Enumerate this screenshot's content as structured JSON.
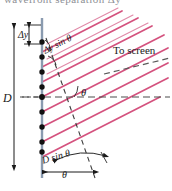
{
  "figure": {
    "name": "diffraction-grating-path-difference-diagram",
    "type": "optics-ray-diagram",
    "background_color": "#ffffff"
  },
  "colors": {
    "ray": "#d4527e",
    "ray_light": "#e08aa8",
    "grating_line": "#8a9bb0",
    "ink": "#1a1a1a",
    "dash": "#4d4d4d",
    "clipped_text": "#8e9096"
  },
  "clipped_top_text": "wavefront separation  Δy",
  "labels": {
    "delta_y": "Δy",
    "delta_y_sin_theta": "Δy sin θ",
    "D": "D",
    "D_sin_theta": "D sin θ",
    "theta_middle": "θ",
    "theta_bottom": "θ",
    "to_screen": "To screen"
  },
  "elements": {
    "grating_plane": {
      "name": "grating-plane-vertical-line",
      "orientation": "vertical",
      "x": 42,
      "y_top": 18,
      "y_bottom": 178,
      "color": "#8a9bb0"
    },
    "slits": {
      "name": "slit-dot-column",
      "count": 9,
      "x": 42,
      "y_values": [
        42,
        57,
        72,
        87,
        97,
        112,
        127,
        142,
        152
      ],
      "color": "#111111",
      "radius": 2.6
    },
    "wavefronts": {
      "name": "pink-wavefront-rays",
      "count": 8,
      "angle_deg": -27,
      "color": "#d4527e"
    },
    "optical_axis": {
      "name": "horizontal-dashed-axis",
      "style": "dashed",
      "y": 97
    },
    "to_screen_ray": {
      "name": "to-screen-dashed-ray",
      "style": "dashed",
      "angle_deg": -27
    },
    "wavefront_normal": {
      "name": "wavefront-normal-dashed-line",
      "style": "dashed",
      "angle_deg": 74
    },
    "D_dimension": {
      "name": "D-dimension-line",
      "x": 14,
      "y_top": 24,
      "y_bottom": 170,
      "arrowheads": "both"
    },
    "delta_y_dimension": {
      "name": "delta-y-dimension-line",
      "x": 27,
      "y_top": 24,
      "y_bottom": 45,
      "arrowheads": "both"
    }
  }
}
